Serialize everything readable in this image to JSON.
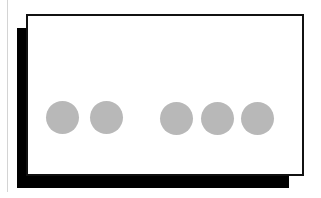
{
  "diagram": {
    "colors": {
      "frame": "#111111",
      "shadow": "#000000",
      "dot": "#b8b8b8",
      "guide_line": "#d4d4d4",
      "background": "#ffffff"
    },
    "groups": [
      {
        "name": "left-group",
        "count": 2
      },
      {
        "name": "right-group",
        "count": 3
      }
    ],
    "dots": [
      {
        "cx": 63,
        "cy": 118
      },
      {
        "cx": 106,
        "cy": 118
      },
      {
        "cx": 177,
        "cy": 118
      },
      {
        "cx": 218,
        "cy": 118
      },
      {
        "cx": 258,
        "cy": 118
      }
    ]
  }
}
